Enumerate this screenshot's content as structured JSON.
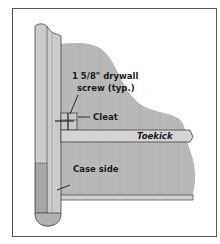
{
  "diagram": {
    "labels": {
      "screw_line1": "1 5/8\" drywall",
      "screw_line2": "screw (typ.)",
      "cleat": "Cleat",
      "toekick": "Toekick",
      "case_side": "Case side"
    },
    "colors": {
      "frame": "#555555",
      "panel_fill": "#c9c9c9",
      "panel_dark": "#a9a9a9",
      "blob_fill": "#b8b8b8",
      "board_fill": "#d2d2d2",
      "line": "#333333"
    }
  }
}
